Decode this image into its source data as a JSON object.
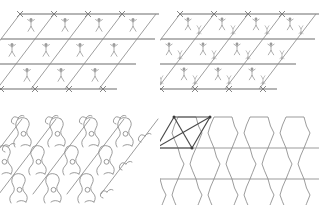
{
  "figure": {
    "background_color": "#ffffff",
    "line_color": "#8d8d8d",
    "accent_color": "#4a4a4a",
    "panel_count": 4
  },
  "panels": [
    {
      "id": "top-left",
      "name": "p1-stick-figure-lattice",
      "motif": "single upright stick figure",
      "motif_count_per_cell": 1,
      "symmetry_label": "p1",
      "lattice_type": "oblique",
      "columns": 4,
      "rows": 3,
      "cell_width": 34,
      "cell_shear": 19,
      "cell_height": 25,
      "origin_x": 20,
      "origin_y": 14,
      "vertex_marker": "cross-tick"
    },
    {
      "id": "top-right",
      "name": "p2-stick-figure-lattice",
      "motif": "upright stick figure plus inverted stick figure",
      "motif_count_per_cell": 2,
      "symmetry_label": "p2",
      "lattice_type": "oblique",
      "columns": 4,
      "rows": 3,
      "cell_width": 34,
      "cell_shear": 19,
      "cell_height": 25,
      "origin_x": 20,
      "origin_y": 14,
      "vertex_marker": "cross-tick"
    },
    {
      "id": "bottom-left",
      "name": "molecular-chain-network",
      "motif": "linked chain with ring atoms and terminal C groups",
      "symmetry_label": "p1",
      "columns": 4,
      "rows": 3,
      "atom_marker": "open-circle",
      "terminal_group": "C",
      "cell_width": 34,
      "cell_shear": 19,
      "cell_height": 28,
      "origin_x": 22,
      "origin_y": 16
    },
    {
      "id": "bottom-right",
      "name": "tessellated-tile-network",
      "motif": "shield-shaped interlocking tile",
      "symmetry_label": "p2",
      "columns": 4,
      "rows": 3,
      "unit_cell_highlighted": true,
      "unit_cell_color": "#4a4a4a",
      "unit_cell_node_marker": "filled-dot",
      "cell_width": 36,
      "cell_shear": 18,
      "cell_height": 31,
      "origin_x": 18,
      "origin_y": 14
    }
  ]
}
